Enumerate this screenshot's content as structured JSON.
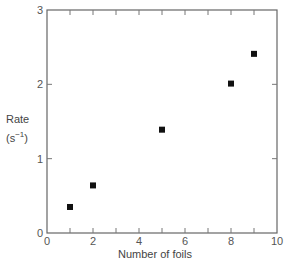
{
  "chart_data": {
    "type": "scatter",
    "title": "",
    "xlabel": "Number of foils",
    "ylabel": "Rate",
    "ylabel_unit": "(s−1)",
    "xlim": [
      0,
      10
    ],
    "ylim": [
      0,
      3
    ],
    "x_ticks": [
      0,
      2,
      4,
      6,
      8,
      10
    ],
    "x_minor_ticks": [
      1,
      3,
      5,
      7,
      9
    ],
    "y_ticks": [
      0,
      1,
      2,
      3
    ],
    "grid": false,
    "legend": null,
    "marker": "square",
    "marker_color": "#111111",
    "series": [
      {
        "name": "Rate",
        "x": [
          1,
          2,
          5,
          8,
          9
        ],
        "y": [
          0.35,
          0.64,
          1.39,
          2.01,
          2.41
        ]
      }
    ]
  },
  "labels": {
    "y_title": "Rate",
    "y_unit_prefix": "(s",
    "y_unit_exp": "−1",
    "y_unit_suffix": ")",
    "x_title": "Number of foils"
  }
}
